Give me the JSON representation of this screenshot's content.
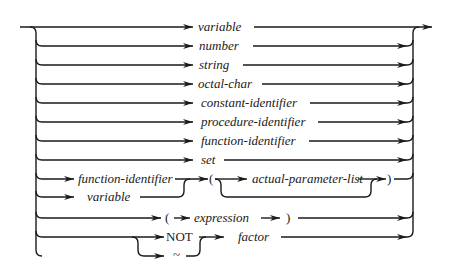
{
  "diagram": {
    "type": "syntax-diagram",
    "title": "factor",
    "alternatives": [
      {
        "label": "variable",
        "style": "italic"
      },
      {
        "label": "number",
        "style": "italic"
      },
      {
        "label": "string",
        "style": "italic"
      },
      {
        "label": "octal-char",
        "style": "italic"
      },
      {
        "label": "constant-identifier",
        "style": "italic"
      },
      {
        "label": "procedure-identifier",
        "style": "italic"
      },
      {
        "label": "function-identifier",
        "style": "italic"
      },
      {
        "label": "set",
        "style": "italic"
      }
    ],
    "call": {
      "fn_label": "function-identifier",
      "var_label": "variable",
      "open_paren": "(",
      "params_label": "actual-parameter-list",
      "close_paren": ")"
    },
    "paren_expr": {
      "open_paren": "(",
      "expr_label": "expression",
      "close_paren": ")"
    },
    "negation": {
      "not_label": "NOT",
      "tilde_label": "~",
      "factor_label": "factor"
    }
  }
}
